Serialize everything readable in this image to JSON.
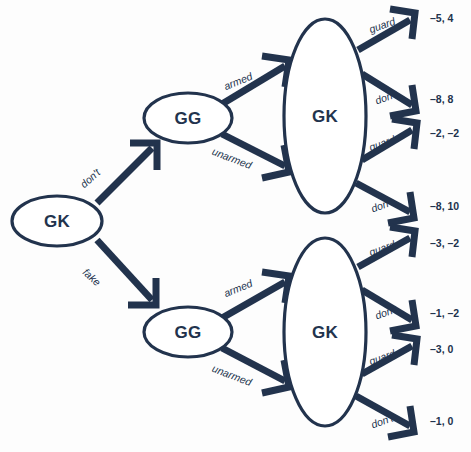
{
  "diagram": {
    "colors": {
      "ink": "#22334d",
      "background": "#fdfdfd",
      "node_fill": "#ffffff"
    },
    "nodes": [
      {
        "id": "root",
        "label": "GK",
        "cx": 57,
        "cy": 221,
        "rx": 45,
        "ry": 25
      },
      {
        "id": "gg_top",
        "label": "GG",
        "cx": 188,
        "cy": 118,
        "rx": 44,
        "ry": 25
      },
      {
        "id": "gk_top",
        "label": "GK",
        "cx": 325,
        "cy": 116,
        "rx": 41,
        "ry": 97
      },
      {
        "id": "gg_bottom",
        "label": "GG",
        "cx": 188,
        "cy": 332,
        "rx": 44,
        "ry": 25
      },
      {
        "id": "gk_bottom",
        "label": "GK",
        "cx": 325,
        "cy": 332,
        "rx": 41,
        "ry": 94
      }
    ],
    "edges": [
      {
        "id": "root-dont",
        "label": "don't",
        "from": "root",
        "to": "gg_top",
        "label_angle": -42,
        "label_x": 90,
        "label_y": 178
      },
      {
        "id": "root-fake",
        "label": "fake",
        "from": "root",
        "to": "gg_bottom",
        "label_angle": 42,
        "label_x": 92,
        "label_y": 277
      },
      {
        "id": "ggtop-armed",
        "label": "armed",
        "from": "gg_top",
        "to": "gk_top",
        "label_angle": -22,
        "label_x": 238,
        "label_y": 81
      },
      {
        "id": "ggtop-unarmed",
        "label": "unarmed",
        "from": "gg_top",
        "to": "gk_top",
        "label_angle": 21,
        "label_x": 232,
        "label_y": 158
      },
      {
        "id": "ggbot-armed",
        "label": "armed",
        "from": "gg_bottom",
        "to": "gk_bottom",
        "label_angle": -22,
        "label_x": 238,
        "label_y": 288
      },
      {
        "id": "ggbot-unarmed",
        "label": "unarmed",
        "from": "gg_bottom",
        "to": "gk_bottom",
        "label_angle": 21,
        "label_x": 232,
        "label_y": 375
      }
    ],
    "outcomes": [
      {
        "id": "outcome-1",
        "action": "guard",
        "payoff": "–5, 4",
        "action_angle": -20,
        "action_x": 382,
        "action_y": 25,
        "payoff_x": 430,
        "payoff_y": 18
      },
      {
        "id": "outcome-2",
        "action": "don't",
        "payoff": "–8, 8",
        "action_angle": -20,
        "action_x": 386,
        "action_y": 97,
        "payoff_x": 430,
        "payoff_y": 99
      },
      {
        "id": "outcome-3",
        "action": "guard",
        "payoff": "–2, –2",
        "action_angle": -20,
        "action_x": 382,
        "action_y": 143,
        "payoff_x": 430,
        "payoff_y": 133
      },
      {
        "id": "outcome-4",
        "action": "don't",
        "payoff": "–8, 10",
        "action_angle": -20,
        "action_x": 382,
        "action_y": 205,
        "payoff_x": 430,
        "payoff_y": 206
      },
      {
        "id": "outcome-5",
        "action": "guard",
        "payoff": "–3, –2",
        "action_angle": -20,
        "action_x": 382,
        "action_y": 248,
        "payoff_x": 430,
        "payoff_y": 243
      },
      {
        "id": "outcome-6",
        "action": "don't",
        "payoff": "–1, –2",
        "action_angle": -20,
        "action_x": 386,
        "action_y": 312,
        "payoff_x": 430,
        "payoff_y": 313
      },
      {
        "id": "outcome-7",
        "action": "guard",
        "payoff": "–3, 0",
        "action_angle": -20,
        "action_x": 382,
        "action_y": 357,
        "payoff_x": 430,
        "payoff_y": 349
      },
      {
        "id": "outcome-8",
        "action": "don't",
        "payoff": "–1, 0",
        "action_angle": -20,
        "action_x": 382,
        "action_y": 421,
        "payoff_x": 430,
        "payoff_y": 421
      }
    ],
    "geometry": {
      "edge_paths": [
        {
          "id": "root-dont",
          "line": "M 97 203 L 152 148",
          "head": "M 130 143 L 157 143 L 157 170"
        },
        {
          "id": "root-fake",
          "line": "M 97 240 L 152 300",
          "head": "M 128 305 L 156 305 L 156 278"
        },
        {
          "id": "ggtop-armed",
          "line": "M 222 104 L 285 66",
          "head": "M 262 56 L 289 60 L 285 87"
        },
        {
          "id": "ggtop-unarmed",
          "line": "M 222 134 L 285 166",
          "head": "M 262 178 L 289 172 L 284 145"
        },
        {
          "id": "ggbot-armed",
          "line": "M 222 318 L 285 282",
          "head": "M 262 272 L 289 276 L 285 303"
        },
        {
          "id": "ggbot-unarmed",
          "line": "M 222 348 L 285 381",
          "head": "M 262 393 L 289 387 L 284 360"
        },
        {
          "id": "outcome-1",
          "line": "M 358 50 L 410 20",
          "head": "M 390 9 L 415 13 L 412 39"
        },
        {
          "id": "outcome-2",
          "line": "M 362 74 L 412 105",
          "head": "M 390 116 L 416 111 L 412 85"
        },
        {
          "id": "outcome-3",
          "line": "M 362 160 L 412 130",
          "head": "M 392 119 L 417 123 L 414 149"
        },
        {
          "id": "outcome-4",
          "line": "M 356 183 L 410 212",
          "head": "M 388 223 L 414 218 L 410 192"
        },
        {
          "id": "outcome-5",
          "line": "M 358 267 L 410 238",
          "head": "M 390 227 L 415 231 L 412 257"
        },
        {
          "id": "outcome-6",
          "line": "M 362 290 L 412 320",
          "head": "M 390 331 L 416 326 L 412 300"
        },
        {
          "id": "outcome-7",
          "line": "M 362 374 L 412 346",
          "head": "M 392 335 L 417 339 L 414 365"
        },
        {
          "id": "outcome-8",
          "line": "M 356 396 L 410 426",
          "head": "M 388 437 L 414 432 L 410 406"
        }
      ]
    }
  }
}
